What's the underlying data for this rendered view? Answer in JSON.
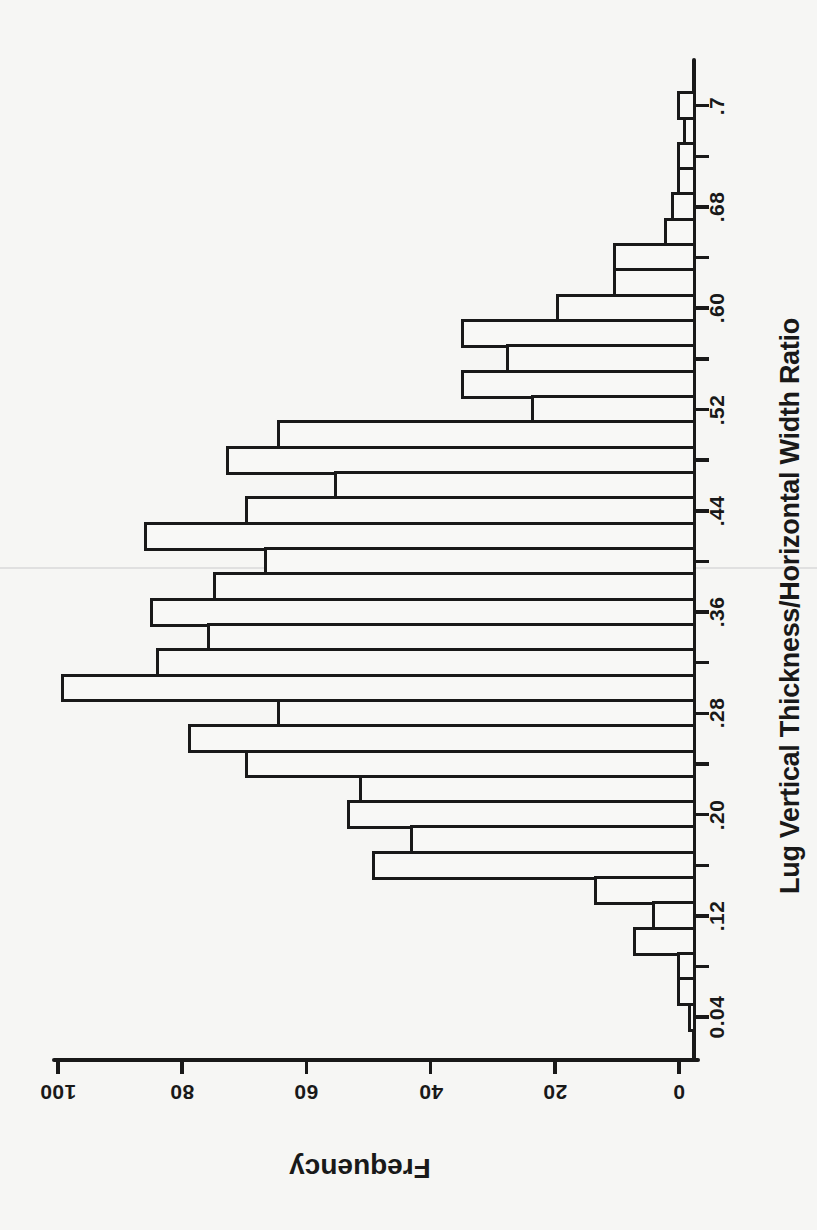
{
  "page": {
    "background_color": "#f6f6f4",
    "ink_color": "#191919"
  },
  "chart_data": {
    "type": "bar",
    "subtype": "histogram",
    "rotation_on_page": "90deg counterclockwise (value axis vertical on right, frequency axis upside-down at bottom)",
    "title": "",
    "xlabel": "Lug Vertical Thickness/Horizontal Width Ratio",
    "ylabel": "Frequency",
    "bin_width": 0.02,
    "bin_centers": [
      0.04,
      0.06,
      0.08,
      0.1,
      0.12,
      0.14,
      0.16,
      0.18,
      0.2,
      0.22,
      0.24,
      0.26,
      0.28,
      0.3,
      0.32,
      0.34,
      0.36,
      0.38,
      0.4,
      0.42,
      0.44,
      0.46,
      0.48,
      0.5,
      0.52,
      0.54,
      0.56,
      0.58,
      0.6,
      0.62,
      0.64,
      0.66,
      0.68,
      0.7,
      0.72,
      0.74,
      0.76
    ],
    "values": [
      1,
      3,
      3,
      10,
      7,
      16,
      51,
      45,
      55,
      53,
      71,
      80,
      66,
      100,
      85,
      77,
      86,
      76,
      68,
      87,
      71,
      57,
      74,
      66,
      26,
      37,
      30,
      37,
      22,
      13,
      13,
      5,
      4,
      3,
      3,
      2,
      3
    ],
    "xtick_labels_low_to_high": [
      "0.04",
      ".12",
      ".20",
      ".28",
      ".36",
      ".44",
      ".52",
      ".60",
      ".68",
      ".7"
    ],
    "ytick_labels": [
      "100",
      "80",
      "60",
      "40",
      "20",
      "0"
    ],
    "ylim": [
      0,
      100
    ],
    "grid": false,
    "legend": false,
    "bar_fill": "#f8f8f6",
    "bar_outline": "#191919",
    "note": "Bars outlined only; minor ticks every other bin center; peak frequency 100 at ratio 0.30"
  }
}
